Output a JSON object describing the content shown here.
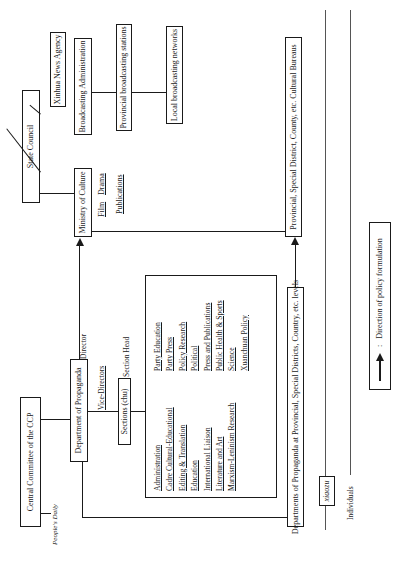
{
  "state_council": {
    "label": "State Council",
    "children": {
      "xinhua": "Xinhua News Agency",
      "broadcasting_admin": "Broadcasting Administration",
      "provincial_broadcasting": "Provincial broadcasting stations",
      "local_broadcasting": "Local broadcasting networks"
    }
  },
  "ministry_of_culture": {
    "label": "Ministry of Culture",
    "sub_drama": "Drama",
    "sub_film": "Film",
    "sub_publications": "Publications"
  },
  "cultural_bureaus": "Provincial, Special District, County, etc. Cultural Bureaus",
  "central_committee": {
    "label": "Central Committee of the CCP",
    "peoples_daily": "People's Daily"
  },
  "dept_propaganda": {
    "label": "Department of Propaganda",
    "director": "Director",
    "vice_directors": "Vice-Directors",
    "sections_box": "Sections (chu)",
    "section_head": "Section Head",
    "sections_left": [
      "Administration",
      "Cadre Cultural-Educational",
      "Editing & Translation",
      "Education",
      "International Liaison",
      "Literature and Art",
      "Marxism-Leninism Research"
    ],
    "sections_right": [
      "Party Education",
      "Party Press",
      "Policy Research",
      "Political",
      "Press and Publications",
      "Public Health & Sports",
      "Science",
      "Xuanchuan Policy"
    ]
  },
  "provincial_propaganda": "Departments of Propaganda at Provincial, Special Districts, Country, etc. levels",
  "xiaozu": "xiaozu",
  "individuals": "Individuals",
  "legend": {
    "symbol": "arrow",
    "separator": ":",
    "label": "Direction of policy formulation"
  }
}
